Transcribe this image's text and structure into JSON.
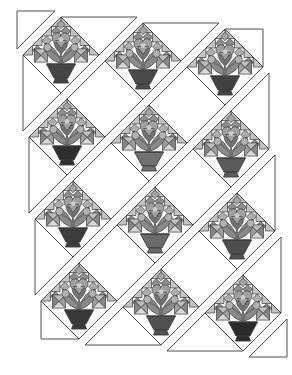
{
  "figure": {
    "type": "quilt-assembly-diagram",
    "width": 292,
    "height": 375
  },
  "palette": {
    "paper": "#fefefe",
    "outline": "#3d3d3d",
    "block_white": "#ffffff",
    "tooth": "#c3c3c3",
    "checker_a": "#8e8e8e",
    "checker_b": "#aeaeae",
    "shoulder_top": "#bdbdbd",
    "shoulder_left": "#858585",
    "shoulder_right": "#9d9d9d",
    "shoulder_bottom": "#d8d8d8",
    "leaf": "#8a8a8a",
    "leaf_dark": "#747474",
    "stem": "#6f6f6f",
    "bloom": "#a0a0a0",
    "bloom_light": "#cccccc",
    "bud": "#b2b2b2",
    "apex_patch": "#a5a5a5"
  },
  "layout": {
    "origin": [
      17,
      11
    ],
    "strip_gap": 6,
    "half_diagonal": 38,
    "quilt_width": 228,
    "quilt_height": 304
  },
  "strips": [
    {
      "name": "row-0-corner",
      "pieces": [
        {
          "kind": "corner-triangle-top-left",
          "points": [
            [
              0,
              0
            ],
            [
              38,
              0
            ],
            [
              0,
              38
            ]
          ]
        }
      ]
    },
    {
      "name": "row-1",
      "pieces": [
        {
          "kind": "side-triangle-left",
          "points": [
            [
              0,
              38
            ],
            [
              38,
              76
            ],
            [
              0,
              114
            ]
          ]
        },
        {
          "kind": "flower-block",
          "center": [
            38,
            38
          ],
          "pot": "#454545"
        },
        {
          "kind": "top-setting-triangle",
          "points": [
            [
              38,
              0
            ],
            [
              114,
              0
            ],
            [
              76,
              38
            ]
          ]
        }
      ]
    },
    {
      "name": "row-2",
      "pieces": [
        {
          "kind": "side-triangle-left",
          "points": [
            [
              0,
              114
            ],
            [
              38,
              152
            ],
            [
              0,
              190
            ]
          ]
        },
        {
          "kind": "flower-block",
          "center": [
            38,
            114
          ],
          "pot": "#2e2e2e"
        },
        {
          "kind": "plain-block",
          "points": [
            [
              76,
              38
            ],
            [
              114,
              76
            ],
            [
              76,
              114
            ],
            [
              38,
              76
            ]
          ]
        },
        {
          "kind": "flower-block",
          "center": [
            114,
            38
          ],
          "pot": "#4a4a4a"
        },
        {
          "kind": "top-setting-triangle",
          "points": [
            [
              114,
              0
            ],
            [
              190,
              0
            ],
            [
              152,
              38
            ]
          ]
        }
      ]
    },
    {
      "name": "row-3",
      "pieces": [
        {
          "kind": "side-triangle-left",
          "points": [
            [
              0,
              190
            ],
            [
              38,
              228
            ],
            [
              0,
              266
            ]
          ]
        },
        {
          "kind": "flower-block",
          "center": [
            38,
            190
          ],
          "pot": "#3c3c3c"
        },
        {
          "kind": "plain-block",
          "points": [
            [
              76,
              114
            ],
            [
              114,
              152
            ],
            [
              76,
              190
            ],
            [
              38,
              152
            ]
          ]
        },
        {
          "kind": "flower-block",
          "center": [
            114,
            114
          ],
          "pot": "#707070"
        },
        {
          "kind": "plain-block",
          "points": [
            [
              152,
              38
            ],
            [
              190,
              76
            ],
            [
              152,
              114
            ],
            [
              114,
              76
            ]
          ]
        },
        {
          "kind": "flower-block",
          "center": [
            190,
            38
          ],
          "pot": "#414141"
        },
        {
          "kind": "corner-triangle-top-right",
          "points": [
            [
              190,
              0
            ],
            [
              228,
              0
            ],
            [
              228,
              38
            ]
          ]
        }
      ]
    },
    {
      "name": "row-4",
      "pieces": [
        {
          "kind": "corner-triangle-bottom-left",
          "points": [
            [
              0,
              266
            ],
            [
              38,
              304
            ],
            [
              0,
              304
            ]
          ]
        },
        {
          "kind": "flower-block",
          "center": [
            38,
            266
          ],
          "pot": "#383838"
        },
        {
          "kind": "plain-block",
          "points": [
            [
              76,
              190
            ],
            [
              114,
              228
            ],
            [
              76,
              266
            ],
            [
              38,
              228
            ]
          ]
        },
        {
          "kind": "flower-block",
          "center": [
            114,
            190
          ],
          "pot": "#6a6a6a"
        },
        {
          "kind": "plain-block",
          "points": [
            [
              152,
              114
            ],
            [
              190,
              152
            ],
            [
              152,
              190
            ],
            [
              114,
              152
            ]
          ]
        },
        {
          "kind": "flower-block",
          "center": [
            190,
            114
          ],
          "pot": "#5b5b5b"
        },
        {
          "kind": "side-triangle-right",
          "points": [
            [
              228,
              38
            ],
            [
              228,
              114
            ],
            [
              190,
              76
            ]
          ]
        }
      ]
    },
    {
      "name": "row-5",
      "pieces": [
        {
          "kind": "bottom-setting-triangle",
          "points": [
            [
              38,
              304
            ],
            [
              114,
              304
            ],
            [
              76,
              266
            ]
          ]
        },
        {
          "kind": "flower-block",
          "center": [
            114,
            266
          ],
          "pot": "#515151"
        },
        {
          "kind": "plain-block",
          "points": [
            [
              152,
              190
            ],
            [
              190,
              228
            ],
            [
              152,
              266
            ],
            [
              114,
              228
            ]
          ]
        },
        {
          "kind": "flower-block",
          "center": [
            190,
            190
          ],
          "pot": "#4e4e4e"
        },
        {
          "kind": "side-triangle-right",
          "points": [
            [
              228,
              114
            ],
            [
              228,
              190
            ],
            [
              190,
              152
            ]
          ]
        }
      ]
    },
    {
      "name": "row-6",
      "pieces": [
        {
          "kind": "bottom-setting-triangle",
          "points": [
            [
              114,
              304
            ],
            [
              190,
              304
            ],
            [
              152,
              266
            ]
          ]
        },
        {
          "kind": "flower-block",
          "center": [
            190,
            266
          ],
          "pot": "#2b2b2b"
        },
        {
          "kind": "side-triangle-right",
          "points": [
            [
              228,
              190
            ],
            [
              228,
              266
            ],
            [
              190,
              228
            ]
          ]
        }
      ]
    },
    {
      "name": "row-7-corner",
      "pieces": [
        {
          "kind": "corner-triangle-bottom-right",
          "points": [
            [
              190,
              304
            ],
            [
              228,
              304
            ],
            [
              228,
              266
            ]
          ]
        }
      ]
    }
  ]
}
